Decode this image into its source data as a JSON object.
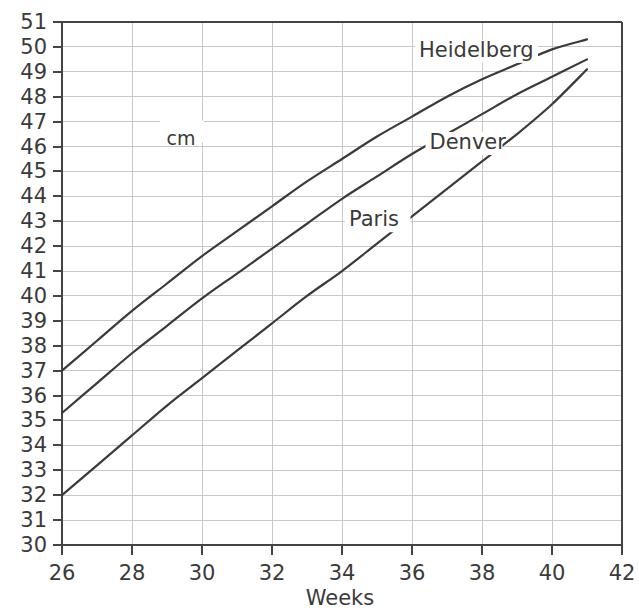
{
  "chart_data": {
    "type": "line",
    "title": "",
    "xlabel": "Weeks",
    "ylabel": "cm",
    "unit_annotation": "cm",
    "xlim": [
      26,
      42
    ],
    "ylim": [
      30,
      51
    ],
    "xticks": [
      26,
      28,
      30,
      32,
      34,
      36,
      38,
      40,
      42
    ],
    "yticks": [
      30,
      31,
      32,
      33,
      34,
      35,
      36,
      37,
      38,
      39,
      40,
      41,
      42,
      43,
      44,
      45,
      46,
      47,
      48,
      49,
      50,
      51
    ],
    "grid": true,
    "grid_x_step": 2,
    "grid_y_step": 1,
    "legend_position": "inline-labels",
    "x": [
      26,
      27,
      28,
      29,
      30,
      31,
      32,
      33,
      34,
      35,
      36,
      37,
      38,
      39,
      40,
      41
    ],
    "series": [
      {
        "name": "Heidelberg",
        "label": "Heidelberg",
        "color": "#3a3a3a",
        "label_x": 36.2,
        "label_y": 49.6,
        "values": [
          37.0,
          38.2,
          39.4,
          40.5,
          41.6,
          42.6,
          43.6,
          44.6,
          45.5,
          46.4,
          47.2,
          48.0,
          48.7,
          49.3,
          49.9,
          50.3
        ]
      },
      {
        "name": "Denver",
        "label": "Denver",
        "color": "#3a3a3a",
        "label_x": 36.5,
        "label_y": 45.9,
        "values": [
          35.3,
          36.5,
          37.7,
          38.8,
          39.9,
          40.9,
          41.9,
          42.9,
          43.9,
          44.8,
          45.7,
          46.5,
          47.3,
          48.1,
          48.8,
          49.5
        ]
      },
      {
        "name": "Paris",
        "label": "Paris",
        "color": "#3a3a3a",
        "label_x": 34.2,
        "label_y": 42.8,
        "values": [
          32.0,
          33.2,
          34.4,
          35.6,
          36.7,
          37.8,
          38.9,
          40.0,
          41.0,
          42.1,
          43.2,
          44.3,
          45.4,
          46.5,
          47.7,
          49.1
        ]
      }
    ]
  },
  "axes": {
    "x_title": "Weeks",
    "y_unit": "cm"
  }
}
